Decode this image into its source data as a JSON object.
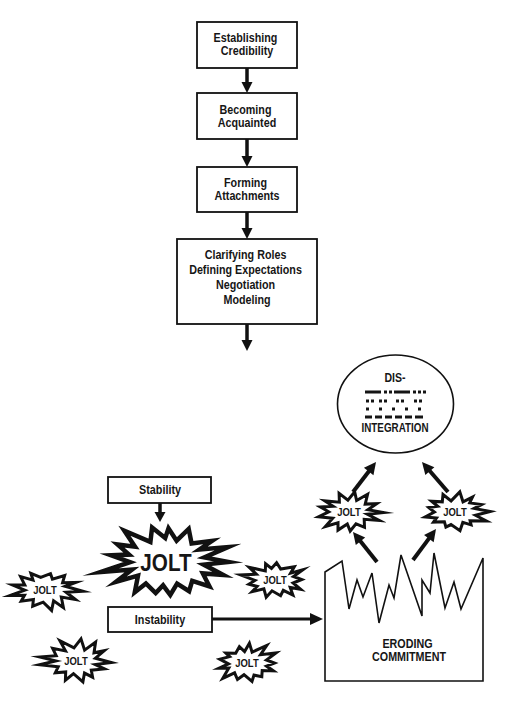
{
  "flow_steps": [
    {
      "lines": [
        "Establishing",
        "Credibility"
      ]
    },
    {
      "lines": [
        "Becoming",
        "Acquainted"
      ]
    },
    {
      "lines": [
        "Forming",
        "Attachments"
      ]
    },
    {
      "lines": [
        "Clarifying Roles",
        "Defining Expectations",
        "Negotiation",
        "Modeling"
      ]
    }
  ],
  "disintegration": {
    "top": "DIS-",
    "bottom": "INTEGRATION"
  },
  "erosion_section": {
    "jolts": [
      "JOLT",
      "JOLT"
    ],
    "label_lines": [
      "ERODING",
      "COMMITMENT"
    ]
  },
  "stability_section": {
    "stability_label": "Stability",
    "central_jolt": "JOLT",
    "instability_label": "Instability",
    "scattered_jolts": [
      "JOLT",
      "JOLT",
      "JOLT",
      "JOLT"
    ]
  },
  "colors": {
    "ink": "#111111",
    "background": "#ffffff"
  }
}
